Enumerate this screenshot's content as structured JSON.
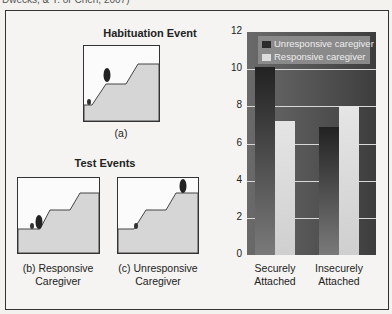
{
  "header_fragment": "Dwecks, & Y. or Chen, 2007)",
  "left": {
    "habituation_title": "Habituation Event",
    "habituation_caption": "(a)",
    "test_title": "Test Events",
    "test_captions": [
      {
        "line1": "(b) Responsive",
        "line2": "Caregiver"
      },
      {
        "line1": "(c) Unresponsive",
        "line2": "Caregiver"
      }
    ]
  },
  "colors": {
    "unresponsive": "#2b2b2b",
    "responsive": "#dddddd",
    "plot_bg": "#555555",
    "hill": "#d6d6d6"
  },
  "chart_data": {
    "type": "bar",
    "title": "",
    "xlabel": "",
    "ylabel": "Mean Looking Time in Seconds",
    "categories": [
      "Securely Attached",
      "Insecurely Attached"
    ],
    "category_lines": [
      [
        "Securely",
        "Attached"
      ],
      [
        "Insecurely",
        "Attached"
      ]
    ],
    "series": [
      {
        "name": "Unresponsive caregiver",
        "values": [
          10.1,
          6.9
        ]
      },
      {
        "name": "Responsive caregiver",
        "values": [
          7.2,
          8.0
        ]
      }
    ],
    "ylim": [
      0,
      12
    ],
    "yticks": [
      "0",
      "2",
      "4",
      "6",
      "8",
      "10",
      "12"
    ],
    "grid": true,
    "legend_position": "top-left inside"
  }
}
